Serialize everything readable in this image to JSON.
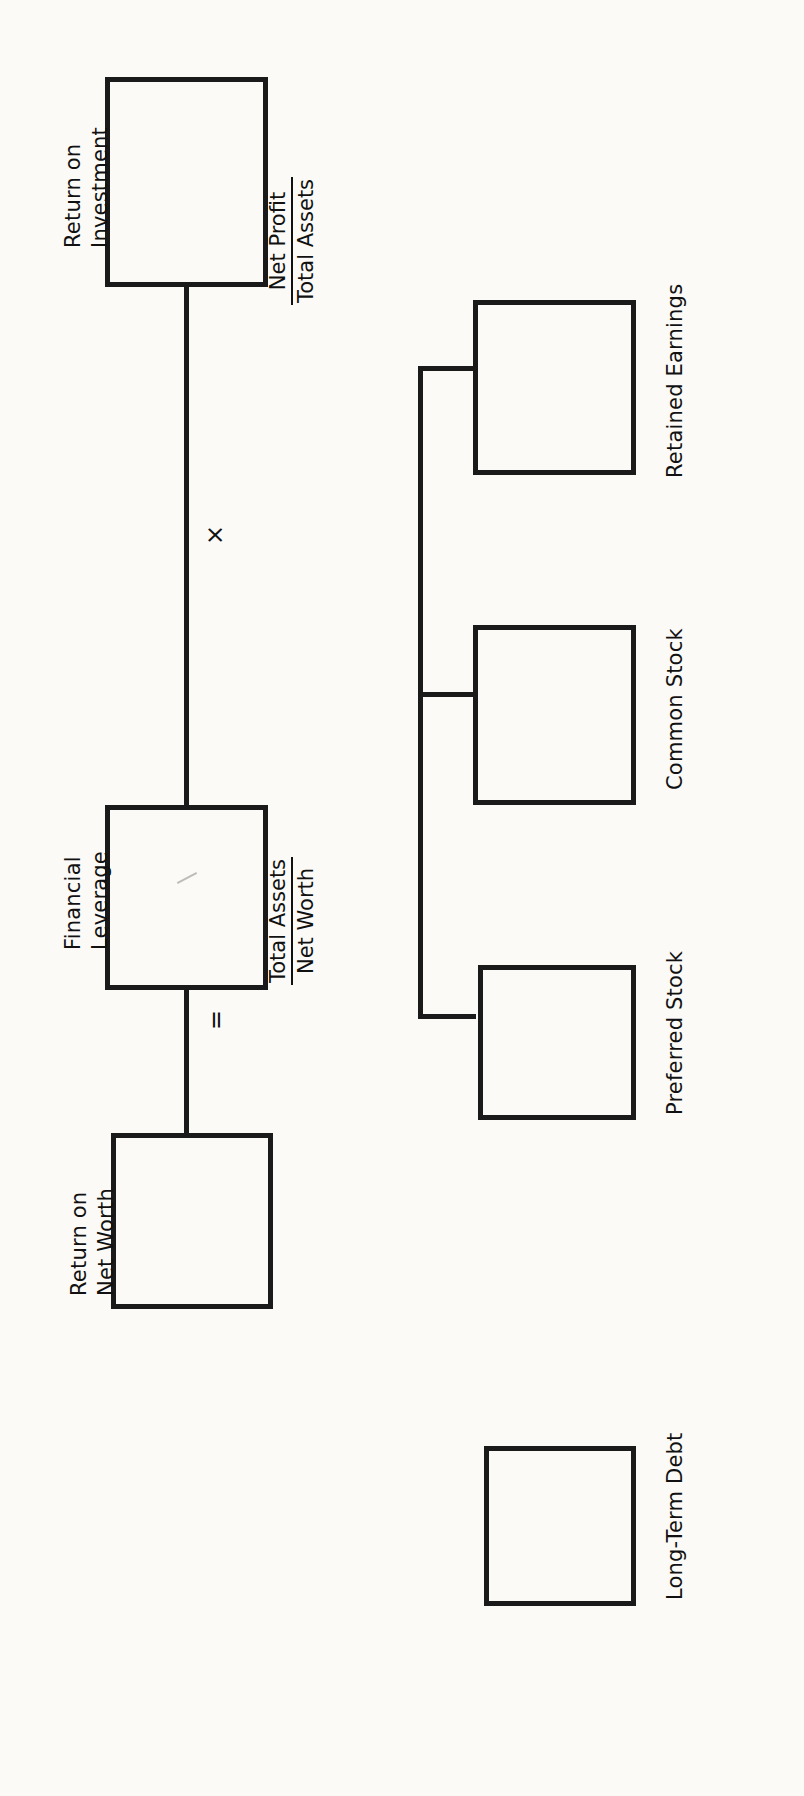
{
  "diagram": {
    "orientation": "rotated-90-ccw",
    "background_color": "#fbfaf7",
    "line_color": "#1a1a1a",
    "nodes": [
      {
        "id": "return-on-investment",
        "label_line1": "Return on",
        "label_line2": "Investment",
        "formula_numerator": "Net Profit",
        "formula_denominator": "Total Assets"
      },
      {
        "id": "financial-leverage",
        "label_line1": "Financial",
        "label_line2": "Leverage",
        "formula_numerator": "Total Assets",
        "formula_denominator": "Net Worth"
      },
      {
        "id": "return-on-net-worth",
        "label_line1": "Return on",
        "label_line2": "Net Worth",
        "formula_numerator": "",
        "formula_denominator": ""
      },
      {
        "id": "retained-earnings",
        "label_line1": "Retained Earnings",
        "label_line2": "",
        "formula_numerator": "",
        "formula_denominator": ""
      },
      {
        "id": "common-stock",
        "label_line1": "Common Stock",
        "label_line2": "",
        "formula_numerator": "",
        "formula_denominator": ""
      },
      {
        "id": "preferred-stock",
        "label_line1": "Preferred Stock",
        "label_line2": "",
        "formula_numerator": "",
        "formula_denominator": ""
      },
      {
        "id": "long-term-debt",
        "label_line1": "Long-Term Debt",
        "label_line2": "",
        "formula_numerator": "",
        "formula_denominator": ""
      }
    ],
    "operators": [
      {
        "id": "multiply",
        "symbol": "×"
      },
      {
        "id": "equals",
        "symbol": "="
      }
    ]
  }
}
